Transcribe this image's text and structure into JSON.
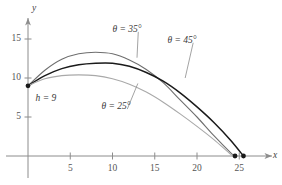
{
  "figure": {
    "background": "#ffffff",
    "axis_color": "#8c8c8c",
    "y_axis_name": "y",
    "x_axis_name": "x"
  },
  "axes": {
    "x_ticks": [
      {
        "value": 5,
        "label": "5"
      },
      {
        "value": 10,
        "label": "10"
      },
      {
        "value": 15,
        "label": "15"
      },
      {
        "value": 20,
        "label": "20"
      },
      {
        "value": 25,
        "label": "25"
      }
    ],
    "y_ticks": [
      {
        "value": 5,
        "label": "5"
      },
      {
        "value": 10,
        "label": "10"
      },
      {
        "value": 15,
        "label": "15"
      }
    ]
  },
  "annotations": {
    "launch_height": "h = 9",
    "theta_35": "θ = 35°",
    "theta_45": "θ = 45°",
    "theta_25": "θ = 25°"
  },
  "chart_data": {
    "type": "line",
    "title": "",
    "xlabel": "x",
    "ylabel": "y",
    "xlim": [
      -1.5,
      29
    ],
    "ylim": [
      -1.5,
      18.5
    ],
    "grid": false,
    "legend": "inline-annotations",
    "initial_height": 9,
    "annotations": [
      {
        "text": "h = 9",
        "x": 0,
        "y": 9
      },
      {
        "text": "θ = 35°",
        "x": 10.5,
        "y": 16.3,
        "leader_to": {
          "x": 12.9,
          "y": 12.6
        }
      },
      {
        "text": "θ = 45°",
        "x": 17.0,
        "y": 14.9,
        "leader_to": {
          "x": 18.6,
          "y": 10.0
        }
      },
      {
        "text": "θ = 25°",
        "x": 9.2,
        "y": 6.4,
        "leader_to": {
          "x": 13.0,
          "y": 9.3
        }
      }
    ],
    "series": [
      {
        "name": "θ = 35°",
        "color": "#6e6e6e",
        "width": 1.1,
        "peak": {
          "x": 8.6,
          "y": 13.3
        },
        "landing": {
          "x": 24.5,
          "y": 0
        },
        "x": [
          0,
          2,
          4,
          6,
          8,
          10,
          12,
          14,
          16,
          18,
          20,
          22,
          24,
          24.5
        ],
        "y": [
          9.0,
          11.0,
          12.4,
          13.1,
          13.3,
          13.1,
          12.3,
          11.1,
          9.4,
          7.2,
          5.0,
          2.6,
          0.4,
          0.0
        ]
      },
      {
        "name": "θ = 45°",
        "color": "#1a1a1a",
        "width": 1.5,
        "peak": {
          "x": 9.2,
          "y": 11.9
        },
        "landing": {
          "x": 25.5,
          "y": 0
        },
        "x": [
          0,
          2,
          4,
          6,
          8,
          10,
          12,
          14,
          16,
          18,
          20,
          22,
          24,
          25.5
        ],
        "y": [
          9.0,
          10.3,
          11.2,
          11.7,
          11.9,
          11.9,
          11.5,
          10.7,
          9.6,
          8.1,
          6.3,
          4.3,
          2.0,
          0.0
        ]
      },
      {
        "name": "θ = 25°",
        "color": "#a9a9a9",
        "width": 1.1,
        "peak": {
          "x": 7.0,
          "y": 10.4
        },
        "landing": {
          "x": 24.4,
          "y": 0
        },
        "x": [
          0,
          2,
          4,
          6,
          8,
          10,
          12,
          14,
          16,
          18,
          20,
          22,
          24,
          24.4
        ],
        "y": [
          9.0,
          9.9,
          10.3,
          10.4,
          10.3,
          9.9,
          9.2,
          8.2,
          6.9,
          5.4,
          3.8,
          2.1,
          0.2,
          0.0
        ]
      }
    ],
    "markers": [
      {
        "x": 0,
        "y": 9,
        "color": "#1a1a1a"
      },
      {
        "x": 24.5,
        "y": 0,
        "color": "#1a1a1a"
      },
      {
        "x": 25.5,
        "y": 0,
        "color": "#1a1a1a"
      }
    ]
  }
}
